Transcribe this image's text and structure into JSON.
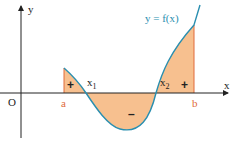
{
  "diagram": {
    "function_label": "y = f(x)",
    "axis_x_label": "x",
    "axis_y_label": "y",
    "origin_label": "O",
    "bounds": {
      "lower": "a",
      "upper": "b"
    },
    "roots": [
      {
        "name": "x1",
        "label": "x",
        "sub": "1"
      },
      {
        "name": "x2",
        "label": "x",
        "sub": "2"
      }
    ],
    "regions": [
      {
        "name": "region-a-x1",
        "sign": "+"
      },
      {
        "name": "region-x1-x2",
        "sign": "–"
      },
      {
        "name": "region-x2-b",
        "sign": "+"
      }
    ],
    "colors": {
      "curve": "#2a8fb0",
      "fill": "#f7c08f",
      "bound_line": "#e06a3a",
      "axis": "#222222"
    }
  }
}
